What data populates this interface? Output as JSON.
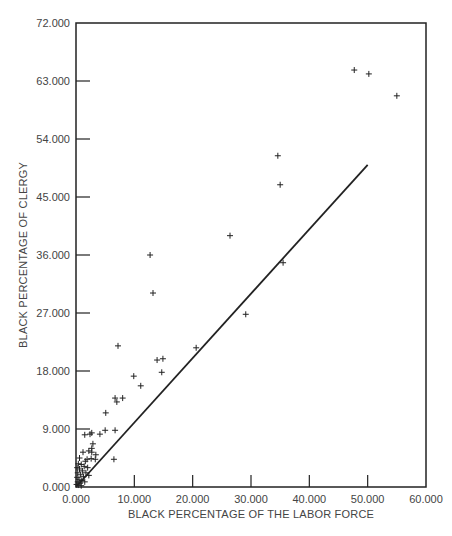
{
  "chart_data": {
    "type": "scatter",
    "title": "",
    "xlabel": "BLACK PERCENTAGE OF THE LABOR FORCE",
    "ylabel": "BLACK PERCENTAGE OF CLERGY",
    "xlim": [
      0,
      60
    ],
    "ylim": [
      0,
      72
    ],
    "x_ticks": [
      "0.000",
      "10.000",
      "20.000",
      "30.000",
      "40.000",
      "50.000",
      "60.000"
    ],
    "x_tick_values": [
      0,
      10,
      20,
      30,
      40,
      50,
      60
    ],
    "y_ticks": [
      "0.000",
      "9.000",
      "18.000",
      "27.000",
      "36.000",
      "45.000",
      "54.000",
      "63.000",
      "72.000"
    ],
    "y_tick_values": [
      0,
      9,
      18,
      27,
      36,
      45,
      54,
      63,
      72
    ],
    "grid": false,
    "legend": null,
    "marker": "+",
    "reference_line": {
      "label": "y = x (parity line)",
      "x": [
        0,
        50
      ],
      "y": [
        0,
        50
      ]
    },
    "series": [
      {
        "name": "States",
        "points": [
          [
            47.7,
            64.7
          ],
          [
            50.2,
            64.1
          ],
          [
            55.0,
            60.7
          ],
          [
            34.6,
            51.4
          ],
          [
            35.0,
            46.9
          ],
          [
            35.5,
            34.8
          ],
          [
            26.4,
            39.0
          ],
          [
            29.1,
            26.8
          ],
          [
            12.7,
            36.0
          ],
          [
            13.2,
            30.1
          ],
          [
            7.2,
            21.9
          ],
          [
            20.6,
            21.6
          ],
          [
            13.9,
            19.7
          ],
          [
            14.9,
            19.9
          ],
          [
            14.7,
            17.8
          ],
          [
            9.9,
            17.2
          ],
          [
            11.1,
            15.7
          ],
          [
            6.7,
            13.8
          ],
          [
            7.0,
            13.2
          ],
          [
            8.0,
            13.8
          ],
          [
            5.1,
            11.5
          ],
          [
            5.0,
            8.8
          ],
          [
            6.7,
            8.8
          ],
          [
            6.5,
            4.3
          ],
          [
            1.5,
            8.1
          ],
          [
            2.4,
            8.2
          ],
          [
            2.7,
            8.4
          ],
          [
            4.1,
            8.2
          ],
          [
            2.9,
            6.7
          ],
          [
            2.7,
            6.0
          ],
          [
            1.2,
            5.4
          ],
          [
            2.2,
            5.6
          ],
          [
            2.7,
            5.4
          ],
          [
            3.4,
            5.0
          ],
          [
            1.9,
            4.3
          ],
          [
            2.6,
            4.4
          ],
          [
            3.3,
            4.3
          ],
          [
            0.4,
            3.6
          ],
          [
            0.9,
            3.5
          ],
          [
            1.4,
            3.2
          ],
          [
            2.0,
            3.0
          ],
          [
            0.6,
            2.8
          ],
          [
            1.1,
            2.5
          ],
          [
            0.3,
            2.2
          ],
          [
            1.7,
            2.2
          ],
          [
            0.8,
            1.9
          ],
          [
            1.3,
            1.6
          ],
          [
            0.2,
            1.5
          ],
          [
            0.5,
            1.2
          ],
          [
            1.0,
            1.0
          ],
          [
            0.3,
            0.8
          ],
          [
            0.7,
            0.6
          ],
          [
            0.1,
            0.4
          ],
          [
            0.4,
            0.3
          ],
          [
            1.5,
            0.8
          ],
          [
            2.2,
            1.8
          ],
          [
            0.9,
            0.2
          ],
          [
            0.2,
            3.0
          ],
          [
            1.6,
            4.0
          ],
          [
            0.6,
            4.5
          ]
        ]
      }
    ]
  }
}
